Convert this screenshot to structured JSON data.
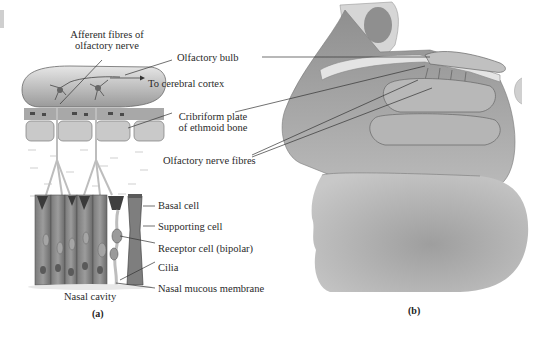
{
  "figure": {
    "panel_a": {
      "caption": "(a)",
      "labels": {
        "afferent": [
          "Afferent fibres of",
          "olfactory nerve"
        ],
        "olfactory_bulb": "Olfactory bulb",
        "to_cortex": "To cerebral cortex",
        "cribriform": [
          "Cribriform plate",
          "of ethmoid bone"
        ],
        "olfactory_nerve_fibres": "Olfactory nerve fibres",
        "basal_cell": "Basal cell",
        "supporting_cell": "Supporting cell",
        "receptor_cell": "Receptor cell (bipolar)",
        "cilia": "Cilia",
        "nasal_mucous_membrane": "Nasal mucous membrane",
        "nasal_cavity": "Nasal cavity"
      }
    },
    "panel_b": {
      "caption": "(b)"
    },
    "colors": {
      "tissue_light": "#d8d8d8",
      "tissue_mid": "#b5b5b5",
      "tissue_dark": "#6e6e6e",
      "cell_dark": "#4a4a4a",
      "line": "#333333"
    }
  }
}
